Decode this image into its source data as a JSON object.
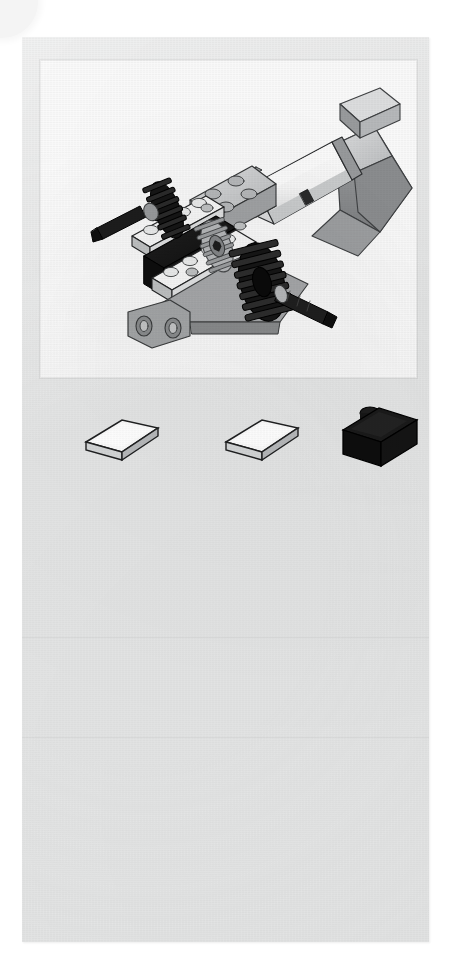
{
  "document": {
    "kind": "lego-building-instruction-page",
    "page_background_color": "#ffffff",
    "panel_background_color": "#e4e5e5",
    "illustration_background_color": "#fdfdfd",
    "step_label": "",
    "page_number": "",
    "caption": ""
  },
  "illustration": {
    "name": "motor-gearbox-assembly",
    "description": "Isometric line drawing of a LEGO Technic motor and gear assembly with two black gears and two black axles",
    "colors": {
      "outline": "#1b1b1b",
      "black_part": "#141414",
      "dark_gray": "#6f7173",
      "mid_gray": "#9b9d9f",
      "light_gray": "#c9cbcc",
      "pale_gray": "#e2e3e4",
      "white_part": "#fbfbfb"
    },
    "components": [
      {
        "name": "motor-body-white-cylinder",
        "color": "white"
      },
      {
        "name": "motor-top-gray-block",
        "color": "light gray"
      },
      {
        "name": "battery-box-gray-wedge",
        "color": "gray"
      },
      {
        "name": "gear-left-black",
        "color": "black"
      },
      {
        "name": "gear-right-black",
        "color": "black"
      },
      {
        "name": "axle-left-black",
        "color": "black"
      },
      {
        "name": "axle-right-black",
        "color": "black"
      },
      {
        "name": "plate-white-1x6",
        "color": "white"
      },
      {
        "name": "plate-white-1x4",
        "color": "white"
      },
      {
        "name": "brick-black-2x4",
        "color": "black"
      },
      {
        "name": "technic-liftarm-gray",
        "color": "gray"
      },
      {
        "name": "baseplate-gray",
        "color": "gray"
      },
      {
        "name": "motor-label-mark",
        "color": "dark"
      }
    ]
  },
  "parts": {
    "row_label": "",
    "items": [
      {
        "name": "part-white-tile-1x2-a",
        "label": "1 x 2 tile",
        "color_name": "white",
        "color_hex": "#fbfbfb",
        "quantity": "",
        "x": 38,
        "width": 80
      },
      {
        "name": "part-white-tile-1x2-b",
        "label": "1 x 2 tile",
        "color_name": "white",
        "color_hex": "#fbfbfb",
        "quantity": "",
        "x": 178,
        "width": 80
      },
      {
        "name": "part-black-brick-2x2",
        "label": "2 x 2 brick",
        "color_name": "black",
        "color_hex": "#141414",
        "quantity": "",
        "x": 293,
        "width": 86
      }
    ]
  },
  "blank_area": {
    "note": ""
  }
}
